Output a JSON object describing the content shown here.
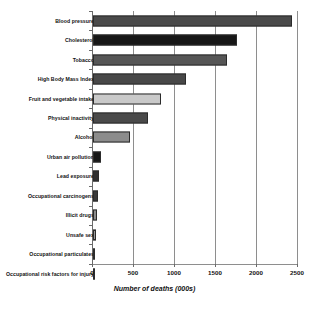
{
  "chart_data": {
    "type": "bar",
    "title": "",
    "subtitle": "",
    "orientation": "horizontal",
    "xlabel": "Number of deaths (000s)",
    "ylabel": "",
    "xlim": [
      0,
      2500
    ],
    "xticks": [
      0,
      500,
      1000,
      1500,
      2000,
      2500
    ],
    "xtick_labels": [
      "0",
      "500",
      "1000",
      "1500",
      "2000",
      "2500"
    ],
    "grid": true,
    "grid_axis": "x",
    "legend": false,
    "legend_position": "none",
    "categories": [
      "Blood pressure",
      "Cholesterol",
      "Tobacco",
      "High Body Mass Index",
      "Fruit and vegetable intake",
      "Physical inactivity",
      "Alcohol",
      "Urban air pollution",
      "Lead exposure",
      "Occupational carcinogens",
      "Illicit drugs",
      "Unsafe sex",
      "Occupational particulates",
      "Occupational risk factors for injury"
    ],
    "values": [
      2430,
      1760,
      1630,
      1130,
      830,
      670,
      450,
      100,
      75,
      60,
      45,
      40,
      30,
      25
    ],
    "bar_colors": [
      "#4a4a4a",
      "#171717",
      "#565656",
      "#484848",
      "#c9c9c9",
      "#4a4a4a",
      "#8c8c8c",
      "#171717",
      "#303030",
      "#3a3a3a",
      "#8c8c8c",
      "#9a9a9a",
      "#232323",
      "#2e2e2e"
    ],
    "bar_edge_color": "#2b2b2b",
    "axis_color": "#6a6a6a",
    "grid_color": "#8e8e8e",
    "background_color": "#ffffff"
  }
}
